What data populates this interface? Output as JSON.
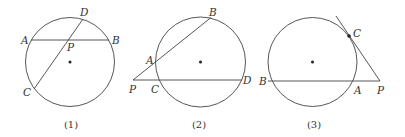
{
  "figures": [
    {
      "caption": "(1)",
      "labels": {
        "A": "A",
        "B": "B",
        "C": "C",
        "D": "D",
        "P": "P"
      },
      "description": "Two chords AB and CD of a circle intersecting at interior point P"
    },
    {
      "caption": "(2)",
      "labels": {
        "A": "A",
        "B": "B",
        "C": "C",
        "D": "D",
        "P": "P"
      },
      "description": "Two secants PAB and PCD drawn from external point P"
    },
    {
      "caption": "(3)",
      "labels": {
        "A": "A",
        "B": "B",
        "C": "C",
        "P": "P"
      },
      "description": "Tangent PC and secant PAB drawn from external point P"
    }
  ],
  "colors": {
    "stroke": "#444444",
    "text": "#333333",
    "background": "#ffffff"
  }
}
